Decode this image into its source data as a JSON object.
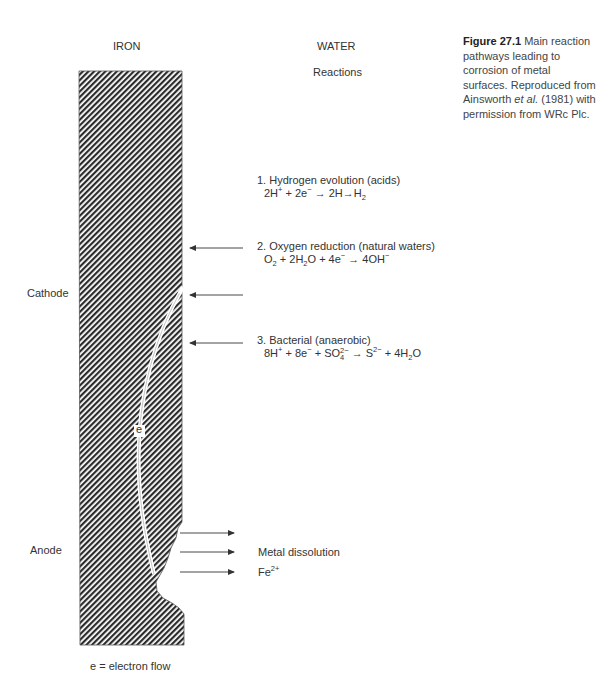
{
  "figure": {
    "column_headers": {
      "left": "IRON",
      "right": "WATER"
    },
    "reactions_heading": "Reactions",
    "caption": {
      "label": "Figure 27.1",
      "text_before_italic": " Main reaction pathways leading to corrosion of metal surfaces. Reproduced from Ainsworth ",
      "italic": "et al.",
      "text_after_italic": " (1981) with permission from WRc Plc."
    },
    "side_labels": {
      "cathode": "Cathode",
      "anode": "Anode"
    },
    "electron_label": "e",
    "legend": "e = electron flow",
    "reactions": [
      {
        "title": "1. Hydrogen evolution (acids)",
        "equation": "2H+ + 2e− → 2H → H2"
      },
      {
        "title": "2. Oxygen reduction (natural waters)",
        "equation": "O2 + 2H2O + 4e− → 4OH−"
      },
      {
        "title": "3. Bacterial (anaerobic)",
        "equation": "8H+ + 8e− + SO4 2− → S2− + 4H2O"
      }
    ],
    "anode_products": {
      "line1": "Metal dissolution",
      "line2": "Fe",
      "line2_sup": "2+"
    },
    "colors": {
      "hatch": "#2b2b2b",
      "background": "#ffffff",
      "arrow": "#333333"
    }
  }
}
